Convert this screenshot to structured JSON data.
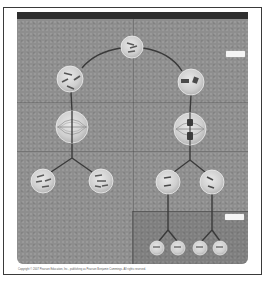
{
  "figure": {
    "title": "",
    "background_color": "#8e8e8e",
    "header_bar_color": "#2e2e2e",
    "line_color": "#3a3a3a",
    "cell_fill": "#d6d6d6",
    "chromosome_color": "#555555"
  },
  "labels": {
    "right_top_label": "",
    "bottom_right_label": ""
  },
  "nodes": {
    "parent": {
      "cx": 132,
      "cy": 47,
      "r": 11,
      "name": "parent-cell"
    },
    "mitosis_prophase": {
      "cx": 70,
      "cy": 79,
      "r": 13,
      "name": "mitosis-prophase-cell"
    },
    "meiosis_prophase": {
      "cx": 191,
      "cy": 82,
      "r": 13,
      "name": "meiosis-prophase-cell"
    },
    "mitosis_metaphase": {
      "cx": 72,
      "cy": 127,
      "r": 16,
      "name": "mitosis-metaphase-cell"
    },
    "meiosis_metaphase": {
      "cx": 190,
      "cy": 129,
      "r": 16,
      "name": "meiosis-metaphase-cell"
    },
    "mitosis_daughters": [
      {
        "cx": 43,
        "cy": 181,
        "r": 12
      },
      {
        "cx": 101,
        "cy": 181,
        "r": 12
      }
    ],
    "meiosis_daughters": [
      {
        "cx": 168,
        "cy": 182,
        "r": 12
      },
      {
        "cx": 212,
        "cy": 182,
        "r": 12
      }
    ],
    "meiosis_gametes": [
      {
        "cx": 157,
        "cy": 248,
        "r": 7
      },
      {
        "cx": 178,
        "cy": 248,
        "r": 7
      },
      {
        "cx": 200,
        "cy": 248,
        "r": 7
      },
      {
        "cx": 220,
        "cy": 248,
        "r": 7
      }
    ]
  },
  "footer": {
    "copyright": "Copyright © 2007 Pearson Education, Inc., publishing as Pearson Benjamin Cummings. All rights reserved."
  }
}
